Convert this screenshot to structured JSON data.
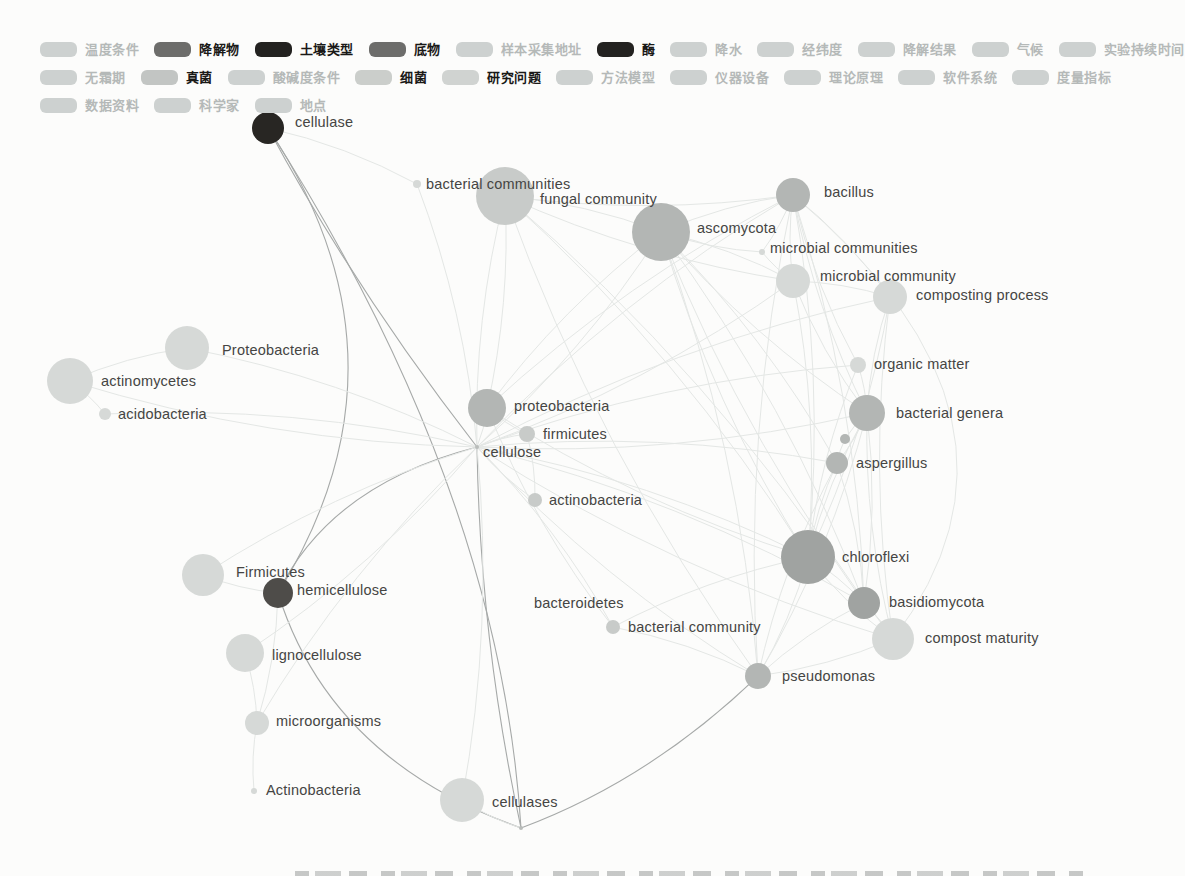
{
  "colors": {
    "page_bg": "#fcfcfb",
    "edge_strong": "#a6a9a8",
    "edge_faint": "#e4e7e5",
    "label_text": "#454543",
    "legend_active_text": "#1a1917",
    "legend_faded_text": "#b5b9b8",
    "swatches": {
      "faded": "#cdd1d0",
      "dark": "#6d6d6b",
      "black": "#232220",
      "fungi": "#c2c5c3",
      "bacteria": "#cbcecb",
      "research": "#d0d3d1"
    },
    "nodes": {
      "light": "#d6d9d7",
      "mlight": "#c8cbc9",
      "medium": "#b3b6b4",
      "mediumdark": "#a0a3a1",
      "dark": "#4e4c49",
      "black": "#282623",
      "hub": "#b9bcba"
    }
  },
  "legend": {
    "rows": [
      [
        {
          "label": "温度条件",
          "active": false,
          "swatch": "faded"
        },
        {
          "label": "降解物",
          "active": true,
          "swatch": "dark"
        },
        {
          "label": "土壤类型",
          "active": true,
          "swatch": "black"
        },
        {
          "label": "底物",
          "active": true,
          "swatch": "dark"
        },
        {
          "label": "样本采集地址",
          "active": false,
          "swatch": "faded"
        },
        {
          "label": "酶",
          "active": true,
          "swatch": "black"
        },
        {
          "label": "降水",
          "active": false,
          "swatch": "faded"
        },
        {
          "label": "经纬度",
          "active": false,
          "swatch": "faded"
        },
        {
          "label": "降解结果",
          "active": false,
          "swatch": "faded"
        },
        {
          "label": "气候",
          "active": false,
          "swatch": "faded"
        },
        {
          "label": "实验持续时间",
          "active": false,
          "swatch": "faded"
        }
      ],
      [
        {
          "label": "无霜期",
          "active": false,
          "swatch": "faded"
        },
        {
          "label": "真菌",
          "active": true,
          "swatch": "fungi"
        },
        {
          "label": "酸碱度条件",
          "active": false,
          "swatch": "faded"
        },
        {
          "label": "细菌",
          "active": true,
          "swatch": "bacteria"
        },
        {
          "label": "研究问题",
          "active": true,
          "swatch": "research"
        },
        {
          "label": "方法模型",
          "active": false,
          "swatch": "faded"
        },
        {
          "label": "仪器设备",
          "active": false,
          "swatch": "faded"
        },
        {
          "label": "理论原理",
          "active": false,
          "swatch": "faded"
        },
        {
          "label": "软件系统",
          "active": false,
          "swatch": "faded"
        },
        {
          "label": "度量指标",
          "active": false,
          "swatch": "faded"
        }
      ],
      [
        {
          "label": "数据资料",
          "active": false,
          "swatch": "faded"
        },
        {
          "label": "科学家",
          "active": false,
          "swatch": "faded"
        },
        {
          "label": "地点",
          "active": false,
          "swatch": "faded"
        }
      ]
    ]
  },
  "graph": {
    "nodes": [
      {
        "id": "cellulase",
        "label": "cellulase",
        "x": 268,
        "y": 128,
        "r": 16,
        "color": "black",
        "dx": 27,
        "dy": -6
      },
      {
        "id": "bc_dot",
        "label": "bacterial communities",
        "x": 417,
        "y": 184,
        "r": 4,
        "color": "light",
        "dx": 9,
        "dy": 0
      },
      {
        "id": "fungal",
        "label": "fungal community",
        "x": 505,
        "y": 196,
        "r": 29,
        "color": "mlight",
        "dx": 35,
        "dy": 3
      },
      {
        "id": "asco",
        "label": "ascomycota",
        "x": 661,
        "y": 232,
        "r": 29,
        "color": "medium",
        "dx": 36,
        "dy": -4
      },
      {
        "id": "bacillus",
        "label": "bacillus",
        "x": 793,
        "y": 195,
        "r": 17,
        "color": "medium",
        "dx": 31,
        "dy": -3
      },
      {
        "id": "micos",
        "label": "microbial communities",
        "x": 762,
        "y": 252,
        "r": 3,
        "color": "light",
        "dx": 8,
        "dy": -4
      },
      {
        "id": "mico",
        "label": "microbial community",
        "x": 793,
        "y": 281,
        "r": 17,
        "color": "light",
        "dx": 27,
        "dy": -5
      },
      {
        "id": "compproc",
        "label": "composting process",
        "x": 890,
        "y": 297,
        "r": 17,
        "color": "light",
        "dx": 26,
        "dy": -2
      },
      {
        "id": "Proteo",
        "label": "Proteobacteria",
        "x": 187,
        "y": 348,
        "r": 22,
        "color": "light",
        "dx": 35,
        "dy": 2
      },
      {
        "id": "actino",
        "label": "actinomycetes",
        "x": 70,
        "y": 381,
        "r": 23,
        "color": "light",
        "dx": 31,
        "dy": 0
      },
      {
        "id": "acido",
        "label": "acidobacteria",
        "x": 105,
        "y": 414,
        "r": 6,
        "color": "light",
        "dx": 13,
        "dy": 0
      },
      {
        "id": "organic",
        "label": "organic matter",
        "x": 858,
        "y": 365,
        "r": 8,
        "color": "light",
        "dx": 16,
        "dy": -1
      },
      {
        "id": "bgenera",
        "label": "bacterial genera",
        "x": 867,
        "y": 413,
        "r": 18,
        "color": "medium",
        "dx": 29,
        "dy": 0
      },
      {
        "id": "dot_r",
        "label": "",
        "x": 845,
        "y": 439,
        "r": 5,
        "color": "medium",
        "dx": 0,
        "dy": 0
      },
      {
        "id": "asperg",
        "label": "aspergillus",
        "x": 837,
        "y": 463,
        "r": 11,
        "color": "medium",
        "dx": 19,
        "dy": 0
      },
      {
        "id": "proteo_c",
        "label": "proteobacteria",
        "x": 487,
        "y": 408,
        "r": 19,
        "color": "medium",
        "dx": 27,
        "dy": -2
      },
      {
        "id": "firm_s",
        "label": "firmicutes",
        "x": 527,
        "y": 434,
        "r": 8,
        "color": "mlight",
        "dx": 16,
        "dy": 0
      },
      {
        "id": "cellulose",
        "label": "cellulose",
        "x": 477,
        "y": 447,
        "r": 2,
        "color": "hub",
        "dx": 6,
        "dy": 5
      },
      {
        "id": "actinob_s",
        "label": "actinobacteria",
        "x": 535,
        "y": 500,
        "r": 7,
        "color": "mlight",
        "dx": 14,
        "dy": 0
      },
      {
        "id": "chloro",
        "label": "chloroflexi",
        "x": 808,
        "y": 557,
        "r": 27,
        "color": "mediumdark",
        "dx": 34,
        "dy": 0
      },
      {
        "id": "Firmicutes_l",
        "label": "Firmicutes",
        "x": 203,
        "y": 575,
        "r": 21,
        "color": "light",
        "dx": 33,
        "dy": -3
      },
      {
        "id": "hemi",
        "label": "hemicellulose",
        "x": 278,
        "y": 593,
        "r": 15,
        "color": "dark",
        "dx": 19,
        "dy": -3
      },
      {
        "id": "basidio",
        "label": "basidiomycota",
        "x": 864,
        "y": 603,
        "r": 16,
        "color": "mediumdark",
        "dx": 25,
        "dy": -1
      },
      {
        "id": "compmat",
        "label": "compost maturity",
        "x": 893,
        "y": 639,
        "r": 21,
        "color": "light",
        "dx": 32,
        "dy": -1
      },
      {
        "id": "bacteroid",
        "label": "bacteroidetes",
        "x": 530,
        "y": 603,
        "r": 0,
        "color": "light",
        "dx": 4,
        "dy": 0
      },
      {
        "id": "bcomm",
        "label": "bacterial community",
        "x": 613,
        "y": 627,
        "r": 7,
        "color": "mlight",
        "dx": 15,
        "dy": 0
      },
      {
        "id": "pseudo",
        "label": "pseudomonas",
        "x": 758,
        "y": 676,
        "r": 13,
        "color": "medium",
        "dx": 24,
        "dy": 0
      },
      {
        "id": "ligno",
        "label": "lignocellulose",
        "x": 245,
        "y": 653,
        "r": 19,
        "color": "light",
        "dx": 27,
        "dy": 2
      },
      {
        "id": "microorg",
        "label": "microorganisms",
        "x": 257,
        "y": 723,
        "r": 12,
        "color": "light",
        "dx": 19,
        "dy": -2
      },
      {
        "id": "Actinob_dot",
        "label": "Actinobacteria",
        "x": 254,
        "y": 791,
        "r": 3,
        "color": "light",
        "dx": 12,
        "dy": -1
      },
      {
        "id": "cellulases",
        "label": "cellulases",
        "x": 462,
        "y": 800,
        "r": 22,
        "color": "light",
        "dx": 30,
        "dy": 2
      },
      {
        "id": "bottomhub",
        "label": "",
        "x": 521,
        "y": 828,
        "r": 2,
        "color": "hub",
        "dx": 0,
        "dy": 0
      }
    ],
    "edges": [
      {
        "a": "cellulase",
        "b": "cellulose",
        "w": "strong",
        "c": [
          355,
          290
        ]
      },
      {
        "a": "cellulase",
        "b": "hemi",
        "w": "strong",
        "c": [
          423,
          360
        ]
      },
      {
        "a": "cellulase",
        "b": "bottomhub",
        "w": "strong",
        "c": [
          500,
          490
        ]
      },
      {
        "a": "cellulose",
        "b": "hemi",
        "w": "strong",
        "c": [
          330,
          485
        ]
      },
      {
        "a": "cellulose",
        "b": "bottomhub",
        "w": "strong",
        "c": [
          480,
          640
        ]
      },
      {
        "a": "hemi",
        "b": "bottomhub",
        "w": "strong",
        "c": [
          330,
          760
        ]
      },
      {
        "a": "bottomhub",
        "b": "pseudo",
        "w": "strong",
        "c": [
          650,
          780
        ]
      },
      {
        "a": "cellulase",
        "b": "bc_dot",
        "w": "faint"
      },
      {
        "a": "cellulose",
        "b": "bc_dot",
        "w": "faint"
      },
      {
        "a": "cellulose",
        "b": "fungal",
        "w": "faint"
      },
      {
        "a": "cellulose",
        "b": "asco",
        "w": "faint"
      },
      {
        "a": "cellulose",
        "b": "bacillus",
        "w": "faint"
      },
      {
        "a": "cellulose",
        "b": "mico",
        "w": "faint"
      },
      {
        "a": "cellulose",
        "b": "compproc",
        "w": "faint"
      },
      {
        "a": "cellulose",
        "b": "Proteo",
        "w": "faint"
      },
      {
        "a": "cellulose",
        "b": "actino",
        "w": "faint"
      },
      {
        "a": "cellulose",
        "b": "acido",
        "w": "faint"
      },
      {
        "a": "cellulose",
        "b": "organic",
        "w": "faint"
      },
      {
        "a": "cellulose",
        "b": "bgenera",
        "w": "faint"
      },
      {
        "a": "cellulose",
        "b": "asperg",
        "w": "faint"
      },
      {
        "a": "cellulose",
        "b": "proteo_c",
        "w": "faint"
      },
      {
        "a": "cellulose",
        "b": "firm_s",
        "w": "faint"
      },
      {
        "a": "cellulose",
        "b": "actinob_s",
        "w": "faint"
      },
      {
        "a": "cellulose",
        "b": "chloro",
        "w": "faint"
      },
      {
        "a": "cellulose",
        "b": "Firmicutes_l",
        "w": "faint"
      },
      {
        "a": "cellulose",
        "b": "basidio",
        "w": "faint"
      },
      {
        "a": "cellulose",
        "b": "compmat",
        "w": "faint"
      },
      {
        "a": "cellulose",
        "b": "bcomm",
        "w": "faint"
      },
      {
        "a": "cellulose",
        "b": "pseudo",
        "w": "faint"
      },
      {
        "a": "cellulose",
        "b": "ligno",
        "w": "faint"
      },
      {
        "a": "cellulose",
        "b": "microorg",
        "w": "faint"
      },
      {
        "a": "cellulose",
        "b": "cellulases",
        "w": "faint"
      },
      {
        "a": "bacillus",
        "b": "asco",
        "w": "faint"
      },
      {
        "a": "bacillus",
        "b": "fungal",
        "w": "faint"
      },
      {
        "a": "bacillus",
        "b": "mico",
        "w": "faint"
      },
      {
        "a": "bacillus",
        "b": "compproc",
        "w": "faint"
      },
      {
        "a": "bacillus",
        "b": "bgenera",
        "w": "faint"
      },
      {
        "a": "bacillus",
        "b": "chloro",
        "w": "faint"
      },
      {
        "a": "bacillus",
        "b": "pseudo",
        "w": "faint"
      },
      {
        "a": "bacillus",
        "b": "basidio",
        "w": "faint"
      },
      {
        "a": "bacillus",
        "b": "organic",
        "w": "faint"
      },
      {
        "a": "bacillus",
        "b": "compmat",
        "w": "faint",
        "c": [
          1060,
          420
        ]
      },
      {
        "a": "asco",
        "b": "fungal",
        "w": "faint"
      },
      {
        "a": "asco",
        "b": "mico",
        "w": "faint"
      },
      {
        "a": "asco",
        "b": "chloro",
        "w": "faint"
      },
      {
        "a": "asco",
        "b": "pseudo",
        "w": "faint"
      },
      {
        "a": "asco",
        "b": "bgenera",
        "w": "faint"
      },
      {
        "a": "asco",
        "b": "basidio",
        "w": "faint"
      },
      {
        "a": "asco",
        "b": "compmat",
        "w": "faint"
      },
      {
        "a": "asco",
        "b": "asperg",
        "w": "faint"
      },
      {
        "a": "fungal",
        "b": "mico",
        "w": "faint"
      },
      {
        "a": "fungal",
        "b": "chloro",
        "w": "faint"
      },
      {
        "a": "fungal",
        "b": "pseudo",
        "w": "faint"
      },
      {
        "a": "fungal",
        "b": "basidio",
        "w": "faint"
      },
      {
        "a": "micos",
        "b": "bacillus",
        "w": "faint"
      },
      {
        "a": "micos",
        "b": "asco",
        "w": "faint"
      },
      {
        "a": "micos",
        "b": "mico",
        "w": "faint"
      },
      {
        "a": "mico",
        "b": "compproc",
        "w": "faint"
      },
      {
        "a": "mico",
        "b": "bgenera",
        "w": "faint"
      },
      {
        "a": "mico",
        "b": "chloro",
        "w": "faint"
      },
      {
        "a": "compproc",
        "b": "bgenera",
        "w": "faint"
      },
      {
        "a": "compproc",
        "b": "chloro",
        "w": "faint"
      },
      {
        "a": "compproc",
        "b": "compmat",
        "w": "faint"
      },
      {
        "a": "organic",
        "b": "bgenera",
        "w": "faint"
      },
      {
        "a": "organic",
        "b": "chloro",
        "w": "faint"
      },
      {
        "a": "bgenera",
        "b": "asperg",
        "w": "faint"
      },
      {
        "a": "bgenera",
        "b": "chloro",
        "w": "faint"
      },
      {
        "a": "bgenera",
        "b": "basidio",
        "w": "faint"
      },
      {
        "a": "bgenera",
        "b": "compmat",
        "w": "faint"
      },
      {
        "a": "bgenera",
        "b": "pseudo",
        "w": "faint"
      },
      {
        "a": "dot_r",
        "b": "asperg",
        "w": "faint"
      },
      {
        "a": "dot_r",
        "b": "bgenera",
        "w": "faint"
      },
      {
        "a": "asperg",
        "b": "chloro",
        "w": "faint"
      },
      {
        "a": "asperg",
        "b": "basidio",
        "w": "faint"
      },
      {
        "a": "asperg",
        "b": "pseudo",
        "w": "faint"
      },
      {
        "a": "chloro",
        "b": "basidio",
        "w": "faint"
      },
      {
        "a": "chloro",
        "b": "compmat",
        "w": "faint"
      },
      {
        "a": "chloro",
        "b": "pseudo",
        "w": "faint"
      },
      {
        "a": "chloro",
        "b": "bcomm",
        "w": "faint"
      },
      {
        "a": "basidio",
        "b": "compmat",
        "w": "faint"
      },
      {
        "a": "basidio",
        "b": "pseudo",
        "w": "faint"
      },
      {
        "a": "compmat",
        "b": "pseudo",
        "w": "faint"
      },
      {
        "a": "pseudo",
        "b": "bcomm",
        "w": "faint"
      },
      {
        "a": "bcomm",
        "b": "proteo_c",
        "w": "faint"
      },
      {
        "a": "proteo_c",
        "b": "firm_s",
        "w": "faint"
      },
      {
        "a": "proteo_c",
        "b": "asco",
        "w": "faint"
      },
      {
        "a": "proteo_c",
        "b": "fungal",
        "w": "faint"
      },
      {
        "a": "proteo_c",
        "b": "bacillus",
        "w": "faint"
      },
      {
        "a": "proteo_c",
        "b": "chloro",
        "w": "faint"
      },
      {
        "a": "firm_s",
        "b": "actinob_s",
        "w": "faint"
      },
      {
        "a": "Proteo",
        "b": "actino",
        "w": "faint"
      },
      {
        "a": "actino",
        "b": "acido",
        "w": "faint"
      },
      {
        "a": "Firmicutes_l",
        "b": "hemi",
        "w": "faint"
      },
      {
        "a": "ligno",
        "b": "microorg",
        "w": "faint"
      },
      {
        "a": "microorg",
        "b": "Actinob_dot",
        "w": "faint"
      },
      {
        "a": "hemi",
        "b": "microorg",
        "w": "faint"
      },
      {
        "a": "cellulases",
        "b": "bottomhub",
        "w": "faint"
      }
    ]
  },
  "footer": {
    "caption_cutoff": "true"
  }
}
